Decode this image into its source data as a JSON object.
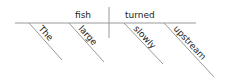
{
  "diagram": {
    "type": "sentence-diagram",
    "subject": "fish",
    "verb": "turned",
    "subject_modifiers": [
      "The",
      "large"
    ],
    "verb_modifiers": [
      "slowly",
      "upstream"
    ],
    "colors": {
      "line": "#9a9a9a",
      "text": "#222222"
    }
  }
}
